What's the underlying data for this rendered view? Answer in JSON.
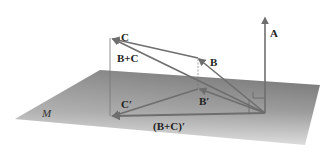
{
  "diagram": {
    "plane_label": "M",
    "vectors": {
      "A": "A",
      "B": "B",
      "C": "C",
      "B_plus_C": "B+C",
      "B_prime": "B′",
      "C_prime": "C′",
      "B_plus_C_prime": "(B+C)′"
    },
    "colors": {
      "plane_dark": "#7a7a7a",
      "plane_light": "#d8d8d8",
      "vector": "#6e6e6e",
      "projection_line": "#888888",
      "label": "#222222"
    }
  }
}
